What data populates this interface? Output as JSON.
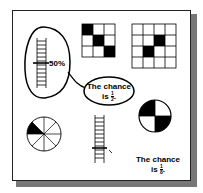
{
  "figure": {
    "label_50": "50%",
    "bubble_text_line1": "The chance",
    "bubble_text_line2_prefix": "is",
    "bubble_fraction": {
      "numerator": "1",
      "denominator": "2"
    },
    "bottom_text_line1": "The chance",
    "bottom_text_line2_prefix": "is",
    "bottom_fraction": {
      "numerator": "1",
      "denominator": "8"
    },
    "grid_3x3_shaded": [
      [
        0,
        0
      ],
      [
        1,
        1
      ],
      [
        2,
        2
      ]
    ],
    "grid_4x4_shaded": [
      [
        1,
        2
      ],
      [
        2,
        1
      ]
    ],
    "pie_8_shaded_sectors": 1,
    "circle_4_shaded_quadrants": 2,
    "colors": {
      "ink": "#000000",
      "shadow": "#777777",
      "paper": "#ffffff"
    }
  }
}
